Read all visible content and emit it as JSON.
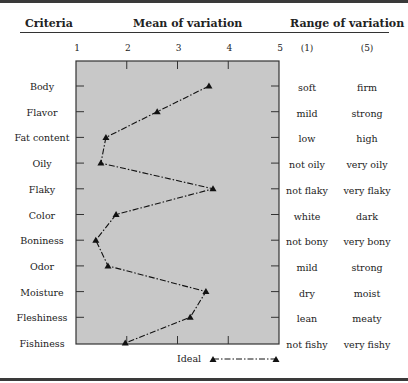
{
  "header": {
    "criteria": "Criteria",
    "mean": "Mean of variation",
    "range": "Range of variation"
  },
  "x_ticks": [
    "1",
    "2",
    "3",
    "4",
    "5"
  ],
  "range_headers": [
    "(1)",
    "(5)"
  ],
  "rows": [
    {
      "criterion": "Body",
      "value": 3.62,
      "low": "soft",
      "high": "firm"
    },
    {
      "criterion": "Flavor",
      "value": 2.6,
      "low": "mild",
      "high": "strong"
    },
    {
      "criterion": "Fat content",
      "value": 1.59,
      "low": "low",
      "high": "high"
    },
    {
      "criterion": "Oily",
      "value": 1.49,
      "low": "not oily",
      "high": "very oily"
    },
    {
      "criterion": "Flaky",
      "value": 3.7,
      "low": "not flaky",
      "high": "very flaky"
    },
    {
      "criterion": "Color",
      "value": 1.79,
      "low": "white",
      "high": "dark"
    },
    {
      "criterion": "Boniness",
      "value": 1.39,
      "low": "not bony",
      "high": "very bony"
    },
    {
      "criterion": "Odor",
      "value": 1.63,
      "low": "mild",
      "high": "strong"
    },
    {
      "criterion": "Moisture",
      "value": 3.56,
      "low": "dry",
      "high": "moist"
    },
    {
      "criterion": "Fleshiness",
      "value": 3.25,
      "low": "lean",
      "high": "meaty"
    },
    {
      "criterion": "Fishiness",
      "value": 1.97,
      "low": "not fishy",
      "high": "very fishy"
    }
  ],
  "legend": {
    "label": "Ideal"
  },
  "colors": {
    "plot_bg": "#c8c8c8",
    "line": "#111111",
    "frame": "#333333"
  },
  "chart_data": {
    "type": "line",
    "title": "Mean of variation",
    "orientation": "horizontal-profile",
    "xlabel": "Mean of variation",
    "ylabel": "Criteria",
    "xlim": [
      1,
      5
    ],
    "x_ticks": [
      1,
      2,
      3,
      4,
      5
    ],
    "grid": false,
    "legend_position": "bottom",
    "categories": [
      "Body",
      "Flavor",
      "Fat content",
      "Oily",
      "Flaky",
      "Color",
      "Boniness",
      "Odor",
      "Moisture",
      "Fleshiness",
      "Fishiness"
    ],
    "series": [
      {
        "name": "Ideal",
        "marker": "triangle",
        "line_style": "dash-dot",
        "values": [
          3.62,
          2.6,
          1.59,
          1.49,
          3.7,
          1.79,
          1.39,
          1.63,
          3.56,
          3.25,
          1.97
        ]
      }
    ],
    "range_labels": {
      "(1)": [
        "soft",
        "mild",
        "low",
        "not oily",
        "not flaky",
        "white",
        "not bony",
        "mild",
        "dry",
        "lean",
        "not fishy"
      ],
      "(5)": [
        "firm",
        "strong",
        "high",
        "very oily",
        "very flaky",
        "dark",
        "very bony",
        "strong",
        "moist",
        "meaty",
        "very fishy"
      ]
    }
  }
}
